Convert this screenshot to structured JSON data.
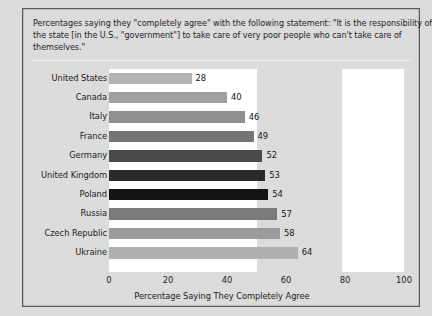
{
  "caption": {
    "line1": "Percentages saying they \"completely agree\" with the following statement: \"It is the responsibility of",
    "line2": "the state [in the U.S., \"government\"] to take care of very poor people who can't take care of",
    "line3": "themselves.\""
  },
  "chart_data": {
    "type": "bar",
    "orientation": "horizontal",
    "xlabel": "Percentage Saying They Completely Agree",
    "ylabel": "",
    "categories": [
      "United States",
      "Canada",
      "Italy",
      "France",
      "Germany",
      "United Kingdom",
      "Poland",
      "Russia",
      "Czech Republic",
      "Ukraine"
    ],
    "values": [
      28,
      40,
      46,
      49,
      52,
      53,
      54,
      57,
      58,
      64
    ],
    "bar_colors": [
      "#b4b4b4",
      "#a0a0a0",
      "#8f8f8f",
      "#757575",
      "#4a4a4a",
      "#2a2a2a",
      "#141414",
      "#7b7b7b",
      "#9b9b9b",
      "#b0b0b0"
    ],
    "xlim": [
      0,
      100
    ],
    "xticks": [
      0,
      20,
      40,
      60,
      80,
      100
    ],
    "xtick_labels": [
      "0",
      "20",
      "40",
      "60",
      "80",
      "100"
    ],
    "grid": false,
    "legend": "none",
    "value_labels_shown": true
  },
  "colors": {
    "figure_background": "#dcdcdc",
    "plot_background": "#ffffff",
    "border": "#5a5a5a",
    "text": "#1b1b1b"
  }
}
